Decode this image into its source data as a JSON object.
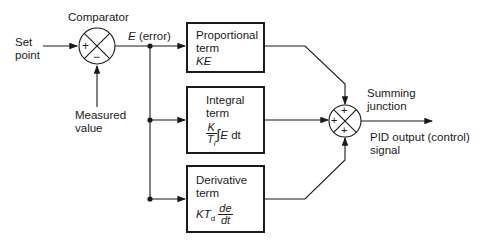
{
  "diagram": {
    "type": "PID controller block diagram",
    "labels": {
      "set_point_line1": "Set",
      "set_point_line2": "point",
      "comparator": "Comparator",
      "error_symbol": "E",
      "error_text": "(error)",
      "measured_line1": "Measured",
      "measured_line2": "value",
      "summing_line1": "Summing",
      "summing_line2": "junction",
      "output_line1": "PID output (control)",
      "output_line2": "signal"
    },
    "comparator_signs": {
      "left": "+",
      "bottom": "−"
    },
    "summing_signs": {
      "top": "+",
      "left": "+",
      "bottom": "+"
    },
    "blocks": {
      "proportional": {
        "line1": "Proportional",
        "line2": "term",
        "formula": "KE"
      },
      "integral": {
        "line1": "Integral",
        "line2": "term",
        "num": "K",
        "den_T": "T",
        "den_sub": "i",
        "integral_sign": "∫",
        "expr_E": "E",
        "expr_dt": " dt"
      },
      "derivative": {
        "line1": "Derivative",
        "line2": "term",
        "formula_K": "KT",
        "formula_sub": "d",
        "num": "de",
        "den": "dt"
      }
    },
    "colors": {
      "line": "#1a1a1a",
      "background": "#ffffff"
    }
  }
}
